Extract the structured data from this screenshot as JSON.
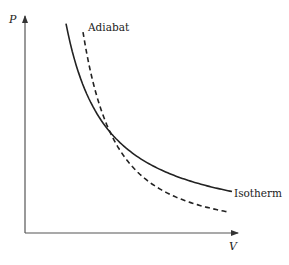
{
  "diagram": {
    "type": "pv-diagram",
    "axes": {
      "y_label": "P",
      "x_label": "V"
    },
    "curves": [
      {
        "name": "isotherm",
        "label": "Isotherm",
        "style": "solid",
        "relation": "PV = const"
      },
      {
        "name": "adiabat",
        "label": "Adiabat",
        "style": "dashed",
        "relation": "PV^gamma = const"
      }
    ],
    "colors": {
      "ink": "#222222",
      "axis": "#555555",
      "background": "#ffffff"
    }
  }
}
